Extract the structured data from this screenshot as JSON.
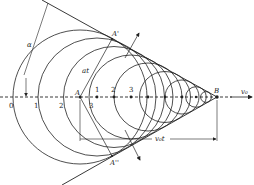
{
  "diagram": {
    "type": "mach-cone-wavefronts",
    "axis_y": 97,
    "apex": {
      "label": "B",
      "x": 217,
      "y": 97
    },
    "source_point": {
      "label": "A",
      "x": 80,
      "y": 97
    },
    "tangent_upper_label": "A'",
    "tangent_lower_label": "A''",
    "velocity_label": "v₀",
    "distance_label": "v₀t",
    "radius_label": "at",
    "angle_label": "α",
    "left_marks": [
      {
        "label": "0",
        "x": 13
      },
      {
        "label": "1",
        "x": 38
      },
      {
        "label": "2",
        "x": 63
      }
    ],
    "right_marks": [
      {
        "label": "1",
        "x": 96
      },
      {
        "label": "2",
        "x": 113
      },
      {
        "label": "3",
        "x": 131
      }
    ],
    "lower_mark": {
      "label": "3",
      "x": 90
    },
    "line_color": "#222222",
    "background": "#ffffff"
  }
}
